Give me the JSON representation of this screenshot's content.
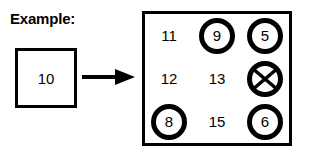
{
  "caption": {
    "text": "Example:"
  },
  "source": {
    "label": "source-number-box",
    "value": "10"
  },
  "arrow": {
    "icon": "right-arrow-icon",
    "direction": "right"
  },
  "grid": {
    "columns": 3,
    "rows": 3,
    "cells": [
      {
        "value": "11",
        "marked": false,
        "crossed": false
      },
      {
        "value": "9",
        "marked": true,
        "crossed": false
      },
      {
        "value": "5",
        "marked": true,
        "crossed": false
      },
      {
        "value": "12",
        "marked": false,
        "crossed": false
      },
      {
        "value": "13",
        "marked": false,
        "crossed": false
      },
      {
        "value": "",
        "marked": true,
        "crossed": true
      },
      {
        "value": "8",
        "marked": true,
        "crossed": false
      },
      {
        "value": "15",
        "marked": false,
        "crossed": false
      },
      {
        "value": "6",
        "marked": true,
        "crossed": false
      }
    ]
  },
  "colors": {
    "ink": "#000000",
    "background": "#ffffff"
  }
}
